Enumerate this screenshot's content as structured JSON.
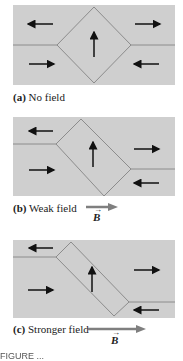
{
  "colors": {
    "panel_fill": "#cfcfcf",
    "domain_wall": "#8c8c8c",
    "arrow": "#111111",
    "field_arrow": "#7f7f7f"
  },
  "panels": [
    {
      "id": "a",
      "letter": "(a)",
      "label": "No field",
      "has_field_arrow": false
    },
    {
      "id": "b",
      "letter": "(b)",
      "label": "Weak field",
      "has_field_arrow": true,
      "field_symbol": "B"
    },
    {
      "id": "c",
      "letter": "(c)",
      "label": "Stronger field",
      "has_field_arrow": true,
      "field_symbol": "B"
    }
  ],
  "footer": {
    "text": "FIGURE ..."
  }
}
